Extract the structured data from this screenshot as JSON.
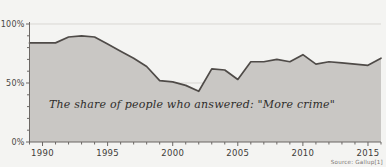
{
  "chart_data": {
    "type": "area",
    "title": "",
    "xlabel": "",
    "ylabel": "",
    "annotation": "The share of people who answered: \"More crime\"",
    "source": "Source: Gallup[1]",
    "grid": true,
    "legend_position": "none",
    "xlim": [
      1989,
      2016
    ],
    "ylim": [
      0,
      100
    ],
    "ytick_labels": [
      "100%",
      "50%",
      "0%"
    ],
    "ytick_values": [
      100,
      50,
      0
    ],
    "xtick_labels": [
      "1990",
      "1995",
      "2000",
      "2005",
      "2010",
      "2015"
    ],
    "xtick_values": [
      1990,
      1995,
      2000,
      2005,
      2010,
      2015
    ],
    "x": [
      1989,
      1990,
      1991,
      1992,
      1993,
      1994,
      1995,
      1996,
      1997,
      1998,
      1999,
      2000,
      2001,
      2002,
      2003,
      2004,
      2005,
      2006,
      2007,
      2008,
      2009,
      2010,
      2011,
      2012,
      2013,
      2014,
      2015,
      2016
    ],
    "values": [
      84,
      84,
      84,
      89,
      90,
      89,
      83,
      77,
      71,
      64,
      52,
      51,
      48,
      43,
      62,
      61,
      53,
      68,
      68,
      70,
      68,
      74,
      66,
      68,
      67,
      66,
      65,
      71
    ],
    "series": [
      {
        "name": "More crime",
        "values": [
          84,
          84,
          84,
          89,
          90,
          89,
          83,
          77,
          71,
          64,
          52,
          51,
          48,
          43,
          62,
          61,
          53,
          68,
          68,
          70,
          68,
          74,
          66,
          68,
          67,
          66,
          65,
          71
        ]
      }
    ],
    "colors": {
      "fill": "#c9c7c4",
      "line": "#4f4b48",
      "axis": "#6b6764",
      "grid": "#d9d7d3",
      "background": "#f4f4f2"
    }
  },
  "cut_title": ""
}
